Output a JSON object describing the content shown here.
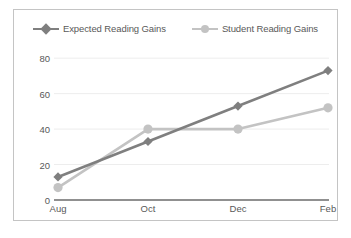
{
  "chart_data": {
    "type": "line",
    "title": "",
    "xlabel": "",
    "ylabel": "",
    "categories": [
      "Aug",
      "Oct",
      "Dec",
      "Feb"
    ],
    "yticks": [
      0,
      20,
      40,
      60,
      80
    ],
    "ylim": [
      0,
      88
    ],
    "grid": true,
    "legend_position": "top-center",
    "series": [
      {
        "name": "Expected Reading Gains",
        "values": [
          13,
          33,
          53,
          73
        ],
        "color": "#7f7f7f",
        "marker": "diamond"
      },
      {
        "name": "Student Reading Gains",
        "values": [
          7,
          40,
          40,
          52
        ],
        "color": "#c3c3c3",
        "marker": "circle"
      }
    ]
  },
  "style": {
    "border_color": "#c4c4c4",
    "grid_color": "#ededed",
    "axis_color": "#6b6b6b",
    "text_color": "#595959",
    "background": "#ffffff"
  }
}
